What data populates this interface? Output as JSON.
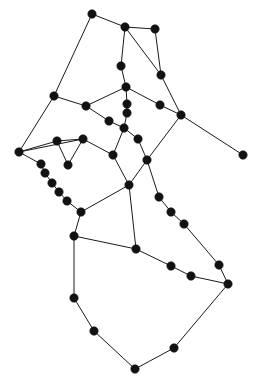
{
  "figure": {
    "title": "",
    "type": "node-link-graph",
    "background_color": "#ffffff",
    "width": 258,
    "height": 383
  },
  "chart_data": {
    "type": "scatter",
    "title": "",
    "subtitle": "",
    "xlabel": "",
    "ylabel": "",
    "xlim": [
      0,
      258
    ],
    "ylim": [
      0,
      383
    ],
    "grid": false,
    "legend": "none",
    "annotations": [],
    "style": {
      "node_color": "#121212",
      "node_radius": 4.2,
      "edge_color": "#1a1a1a",
      "edge_width": 1
    },
    "node_count": 46,
    "edge_count": 54,
    "nodes": [
      {
        "id": 0,
        "x": 92,
        "y": 14
      },
      {
        "id": 1,
        "x": 125,
        "y": 27
      },
      {
        "id": 2,
        "x": 155,
        "y": 29
      },
      {
        "id": 3,
        "x": 121,
        "y": 66
      },
      {
        "id": 4,
        "x": 161,
        "y": 75
      },
      {
        "id": 5,
        "x": 126,
        "y": 87
      },
      {
        "id": 6,
        "x": 54,
        "y": 96
      },
      {
        "id": 7,
        "x": 86,
        "y": 106
      },
      {
        "id": 8,
        "x": 127,
        "y": 104
      },
      {
        "id": 9,
        "x": 127,
        "y": 113
      },
      {
        "id": 10,
        "x": 160,
        "y": 105
      },
      {
        "id": 11,
        "x": 109,
        "y": 121
      },
      {
        "id": 12,
        "x": 124,
        "y": 128
      },
      {
        "id": 13,
        "x": 181,
        "y": 115
      },
      {
        "id": 14,
        "x": 138,
        "y": 139
      },
      {
        "id": 15,
        "x": 19,
        "y": 152
      },
      {
        "id": 16,
        "x": 57,
        "y": 141
      },
      {
        "id": 17,
        "x": 83,
        "y": 139
      },
      {
        "id": 18,
        "x": 113,
        "y": 155
      },
      {
        "id": 19,
        "x": 147,
        "y": 160
      },
      {
        "id": 20,
        "x": 243,
        "y": 155
      },
      {
        "id": 21,
        "x": 68,
        "y": 165
      },
      {
        "id": 22,
        "x": 41,
        "y": 164
      },
      {
        "id": 23,
        "x": 45,
        "y": 173
      },
      {
        "id": 24,
        "x": 52,
        "y": 183
      },
      {
        "id": 25,
        "x": 59,
        "y": 192
      },
      {
        "id": 26,
        "x": 67,
        "y": 201
      },
      {
        "id": 27,
        "x": 129,
        "y": 185
      },
      {
        "id": 28,
        "x": 159,
        "y": 197
      },
      {
        "id": 29,
        "x": 171,
        "y": 212
      },
      {
        "id": 30,
        "x": 81,
        "y": 212
      },
      {
        "id": 31,
        "x": 184,
        "y": 224
      },
      {
        "id": 32,
        "x": 74,
        "y": 236
      },
      {
        "id": 33,
        "x": 136,
        "y": 249
      },
      {
        "id": 34,
        "x": 171,
        "y": 266
      },
      {
        "id": 35,
        "x": 219,
        "y": 265
      },
      {
        "id": 36,
        "x": 191,
        "y": 276
      },
      {
        "id": 37,
        "x": 228,
        "y": 284
      },
      {
        "id": 38,
        "x": 74,
        "y": 298
      },
      {
        "id": 39,
        "x": 94,
        "y": 331
      },
      {
        "id": 40,
        "x": 135,
        "y": 369
      },
      {
        "id": 41,
        "x": 174,
        "y": 348
      }
    ],
    "edges": [
      [
        0,
        1
      ],
      [
        0,
        6
      ],
      [
        1,
        2
      ],
      [
        1,
        3
      ],
      [
        1,
        4
      ],
      [
        2,
        4
      ],
      [
        3,
        5
      ],
      [
        4,
        13
      ],
      [
        5,
        8
      ],
      [
        5,
        7
      ],
      [
        6,
        7
      ],
      [
        6,
        15
      ],
      [
        7,
        11
      ],
      [
        8,
        9
      ],
      [
        9,
        12
      ],
      [
        10,
        13
      ],
      [
        10,
        5
      ],
      [
        11,
        12
      ],
      [
        12,
        14
      ],
      [
        12,
        18
      ],
      [
        13,
        20
      ],
      [
        13,
        19
      ],
      [
        14,
        19
      ],
      [
        15,
        16
      ],
      [
        15,
        17
      ],
      [
        15,
        22
      ],
      [
        16,
        17
      ],
      [
        16,
        21
      ],
      [
        17,
        21
      ],
      [
        17,
        18
      ],
      [
        18,
        27
      ],
      [
        19,
        27
      ],
      [
        19,
        28
      ],
      [
        22,
        23
      ],
      [
        23,
        24
      ],
      [
        24,
        25
      ],
      [
        25,
        26
      ],
      [
        26,
        30
      ],
      [
        27,
        33
      ],
      [
        27,
        30
      ],
      [
        28,
        29
      ],
      [
        29,
        31
      ],
      [
        31,
        35
      ],
      [
        30,
        32
      ],
      [
        32,
        33
      ],
      [
        32,
        38
      ],
      [
        33,
        34
      ],
      [
        34,
        36
      ],
      [
        36,
        37
      ],
      [
        35,
        37
      ],
      [
        37,
        41
      ],
      [
        38,
        39
      ],
      [
        39,
        40
      ],
      [
        40,
        41
      ]
    ]
  }
}
